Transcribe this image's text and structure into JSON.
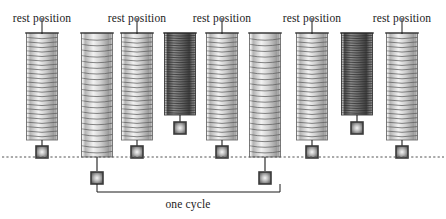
{
  "figure": {
    "background_color": "#ffffff",
    "ink_color": "#1b1b1b",
    "width": 446,
    "height": 219
  },
  "rest_line": {
    "label": "rest position line",
    "y": 157,
    "x_start": 2,
    "x_end": 444,
    "style": "dashed",
    "color": "#555555"
  },
  "labels": {
    "rest_position": "rest position",
    "one_cycle": "one cycle"
  },
  "rest_labels": [
    {
      "text": "rest position",
      "x": 42,
      "y": 12,
      "pointer_x": 42,
      "pointer_top": 18,
      "pointer_bottom": 34
    },
    {
      "text": "rest position",
      "x": 137,
      "y": 12,
      "pointer_x": 137,
      "pointer_top": 18,
      "pointer_bottom": 34
    },
    {
      "text": "rest position",
      "x": 222,
      "y": 12,
      "pointer_x": 222,
      "pointer_top": 18,
      "pointer_bottom": 34
    },
    {
      "text": "rest position",
      "x": 312,
      "y": 12,
      "pointer_x": 312,
      "pointer_top": 18,
      "pointer_bottom": 34
    },
    {
      "text": "rest position",
      "x": 402,
      "y": 12,
      "pointer_x": 402,
      "pointer_top": 18,
      "pointer_bottom": 34
    }
  ],
  "springs": [
    {
      "index": 1,
      "name": "spring-rest-1",
      "state": "rest",
      "cx": 42,
      "width": 31,
      "top": 33,
      "bottom": 140,
      "coil_count": 24,
      "shade": "light",
      "weight_y": 152,
      "stem_top": 140,
      "stem_bottom": 146
    },
    {
      "index": 2,
      "name": "spring-stretched-1",
      "state": "stretched",
      "cx": 97,
      "width": 31,
      "top": 33,
      "bottom": 157,
      "coil_count": 22,
      "shade": "light",
      "weight_y": 178,
      "stem_top": 157,
      "stem_bottom": 171
    },
    {
      "index": 3,
      "name": "spring-rest-2",
      "state": "rest",
      "cx": 137,
      "width": 31,
      "top": 33,
      "bottom": 140,
      "coil_count": 24,
      "shade": "light",
      "weight_y": 152,
      "stem_top": 140,
      "stem_bottom": 146
    },
    {
      "index": 4,
      "name": "spring-compressed-1",
      "state": "compressed",
      "cx": 180,
      "width": 31,
      "top": 33,
      "bottom": 115,
      "coil_count": 34,
      "shade": "dark",
      "weight_y": 128,
      "stem_top": 115,
      "stem_bottom": 122
    },
    {
      "index": 5,
      "name": "spring-rest-3",
      "state": "rest",
      "cx": 222,
      "width": 31,
      "top": 33,
      "bottom": 140,
      "coil_count": 24,
      "shade": "light",
      "weight_y": 152,
      "stem_top": 140,
      "stem_bottom": 146
    },
    {
      "index": 6,
      "name": "spring-stretched-2",
      "state": "stretched",
      "cx": 265,
      "width": 31,
      "top": 33,
      "bottom": 157,
      "coil_count": 22,
      "shade": "light",
      "weight_y": 178,
      "stem_top": 157,
      "stem_bottom": 171
    },
    {
      "index": 7,
      "name": "spring-rest-4",
      "state": "rest",
      "cx": 312,
      "width": 31,
      "top": 33,
      "bottom": 140,
      "coil_count": 24,
      "shade": "light",
      "weight_y": 152,
      "stem_top": 140,
      "stem_bottom": 146
    },
    {
      "index": 8,
      "name": "spring-compressed-2",
      "state": "compressed",
      "cx": 357,
      "width": 31,
      "top": 33,
      "bottom": 115,
      "coil_count": 34,
      "shade": "dark",
      "weight_y": 128,
      "stem_top": 115,
      "stem_bottom": 122
    },
    {
      "index": 9,
      "name": "spring-rest-5",
      "state": "rest",
      "cx": 402,
      "width": 31,
      "top": 33,
      "bottom": 140,
      "coil_count": 24,
      "shade": "light",
      "weight_y": 152,
      "stem_top": 140,
      "stem_bottom": 146
    }
  ],
  "anchors": [
    {
      "cx": 42,
      "y": 33,
      "half_width": 17
    },
    {
      "cx": 97,
      "y": 33,
      "half_width": 17
    },
    {
      "cx": 137,
      "y": 33,
      "half_width": 17
    },
    {
      "cx": 180,
      "y": 33,
      "half_width": 17
    },
    {
      "cx": 222,
      "y": 33,
      "half_width": 17
    },
    {
      "cx": 265,
      "y": 33,
      "half_width": 17
    },
    {
      "cx": 312,
      "y": 33,
      "half_width": 17
    },
    {
      "cx": 357,
      "y": 33,
      "half_width": 17
    },
    {
      "cx": 402,
      "y": 33,
      "half_width": 17
    }
  ],
  "cycle_bracket": {
    "label": "one cycle",
    "left_x": 97,
    "right_x": 280,
    "bar_y": 192,
    "tick_top": 184,
    "text_x": 188,
    "text_y": 198
  },
  "colors": {
    "ink": "#1b1b1b",
    "spring_light_stroke": "#6d6d6d",
    "spring_light_fill": "#c9c9c9",
    "spring_dark_stroke": "#3a3a3a",
    "spring_dark_fill": "#7a7a7a",
    "weight_outer": "#3b3b3b",
    "weight_inner": "#d8d8d8",
    "dash": "#555555"
  }
}
